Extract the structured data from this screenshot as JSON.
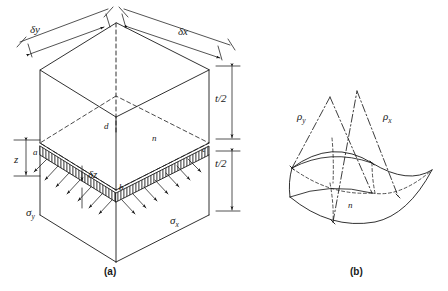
{
  "figure": {
    "background_color": "#ffffff",
    "line_color": "#1a1a1a"
  },
  "panels": [
    {
      "id": "a",
      "caption": "(a)",
      "description": "Isometric plate element of thickness t showing a thin lamina at depth z and the linear bending stress distributions",
      "labels": {
        "dim_y": "δy",
        "dim_x": "δx",
        "half_thickness_upper": "t/2",
        "half_thickness_lower": "t/2",
        "depth": "z",
        "lamina_thickness": "δz",
        "stress_y": "σ",
        "stress_y_sub": "y",
        "stress_x": "σ",
        "stress_x_sub": "x",
        "point_a": "a",
        "point_b": "b",
        "point_c": "c",
        "point_d": "d",
        "point_n": "n"
      }
    },
    {
      "id": "b",
      "caption": "(b)",
      "description": "Doubly curved (saddle) deflected mid-surface with principal radii of curvature",
      "labels": {
        "radius_y": "ρ",
        "radius_y_sub": "y",
        "radius_x": "ρ",
        "radius_x_sub": "x",
        "point_n": "n"
      }
    }
  ]
}
